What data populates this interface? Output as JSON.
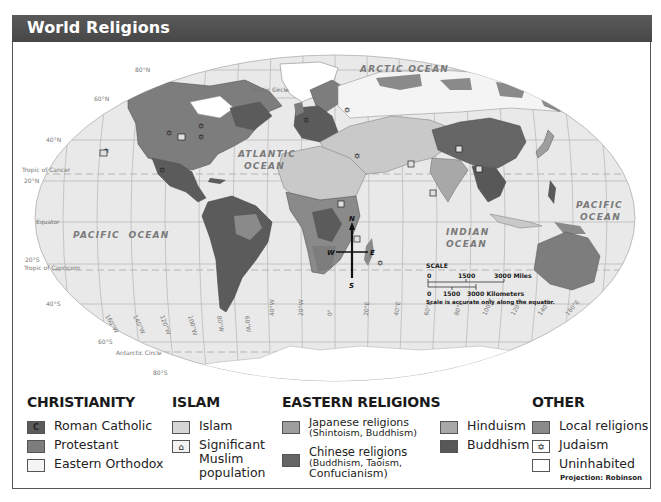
{
  "title": "World Religions",
  "colors": {
    "title_bar": "#4f4f4f",
    "ocean": "#e9e9e9",
    "roman_catholic": "#5b5b5b",
    "protestant": "#7d7d7d",
    "eastern_orthodox": "#f4f4f4",
    "islam": "#c9c9c9",
    "japanese_religions": "#9e9e9e",
    "chinese_religions": "#666666",
    "hinduism": "#a8a8a8",
    "buddhism": "#585858",
    "local_religions": "#8a8a8a",
    "uninhabited": "#ffffff"
  },
  "map": {
    "ocean_labels": {
      "arctic": "ARCTIC OCEAN",
      "atlantic_1": "ATLANTIC",
      "atlantic_2": "OCEAN",
      "pacific_west": "PACIFIC  OCEAN",
      "pacific_east_1": "PACIFIC",
      "pacific_east_2": "OCEAN",
      "indian_1": "INDIAN",
      "indian_2": "OCEAN"
    },
    "lines": {
      "arctic_circle": "Arctic Circle",
      "tropic_cancer": "Tropic of Cancer",
      "equator": "Equator",
      "tropic_capricorn": "Tropic of Capricorn",
      "antarctic_circle": "Antarctic Circle"
    },
    "latitudes": [
      "80°N",
      "60°N",
      "40°N",
      "20°N",
      "20°S",
      "40°S",
      "60°S",
      "80°S"
    ],
    "longitudes": [
      "160°W",
      "140°W",
      "120°W",
      "100°W",
      "80°W",
      "60°W",
      "40°W",
      "20°W",
      "0°",
      "20°E",
      "40°E",
      "60°E",
      "80°E",
      "100°E",
      "120°E",
      "140°E",
      "160°E"
    ],
    "compass": {
      "n": "N",
      "s": "S",
      "e": "E",
      "w": "W"
    },
    "scale": {
      "title": "SCALE",
      "miles_0": "0",
      "miles_mid": "1500",
      "miles_end": "3000 Miles",
      "km_0": "0",
      "km_mid": "1500",
      "km_end": "3000 Kilometers",
      "note": "Scale is accurate only along the equator."
    }
  },
  "legend": {
    "christianity": {
      "heading": "CHRISTIANITY",
      "items": [
        {
          "label": "Roman Catholic",
          "mark": "C"
        },
        {
          "label": "Protestant"
        },
        {
          "label": "Eastern Orthodox"
        }
      ]
    },
    "islam": {
      "heading": "ISLAM",
      "items": [
        {
          "label": "Islam"
        },
        {
          "label_1": "Significant",
          "label_2": "Muslim",
          "label_3": "population"
        }
      ]
    },
    "eastern": {
      "heading": "EASTERN RELIGIONS",
      "items": [
        {
          "label": "Japanese religions",
          "sub": "(Shintoism, Buddhism)"
        },
        {
          "label": "Chinese religions",
          "sub_1": "(Buddhism, Taoism,",
          "sub_2": "Confucianism)"
        },
        {
          "label": "Hinduism"
        },
        {
          "label": "Buddhism"
        }
      ]
    },
    "other": {
      "heading": "OTHER",
      "items": [
        {
          "label": "Local religions"
        },
        {
          "label": "Judaism",
          "mark": "✡"
        },
        {
          "label": "Uninhabited"
        }
      ]
    },
    "projection": "Projection: Robinson"
  }
}
